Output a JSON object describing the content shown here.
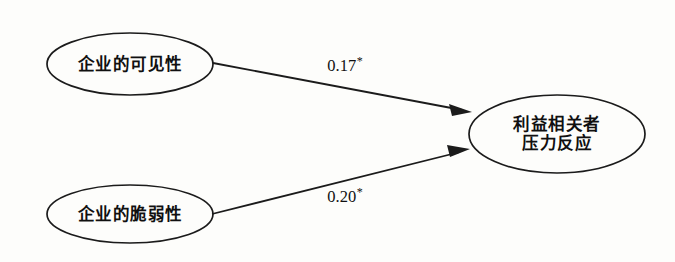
{
  "diagram": {
    "type": "path-model",
    "background_color": "#fdfdfb",
    "line_color": "#1b1b1b",
    "nodes": [
      {
        "id": "visibility",
        "label": "企业的可见性",
        "shape": "ellipse",
        "cx": 130,
        "cy": 64,
        "rx": 83,
        "ry": 31
      },
      {
        "id": "vulnerability",
        "label": "企业的脆弱性",
        "shape": "ellipse",
        "cx": 130,
        "cy": 214,
        "rx": 83,
        "ry": 29
      },
      {
        "id": "stakeholder-pressure-response",
        "label_line1": "利益相关者",
        "label_line2": "压力反应",
        "shape": "ellipse",
        "cx": 557,
        "cy": 134,
        "rx": 88,
        "ry": 39
      }
    ],
    "edges": [
      {
        "id": "visibility-to-response",
        "from": "visibility",
        "to": "stakeholder-pressure-response",
        "coefficient": "0.17",
        "significance": "*",
        "label_x": 345,
        "label_y": 66
      },
      {
        "id": "vulnerability-to-response",
        "from": "vulnerability",
        "to": "stakeholder-pressure-response",
        "coefficient": "0.20",
        "significance": "*",
        "label_x": 345,
        "label_y": 197
      }
    ]
  }
}
